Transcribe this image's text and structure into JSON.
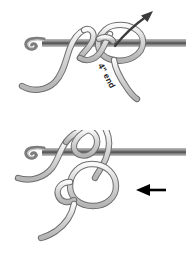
{
  "diagram": {
    "background_color": "#ffffff",
    "yarn_fill_color": "#d2d2d2",
    "yarn_outline_color": "#6e6e6e",
    "hook_color": "#8d8d8d",
    "hook_dark_color": "#4a4a4a",
    "arrow_color": "#3b3b3b",
    "text_color": "#111111"
  },
  "panels": [
    {
      "id": "panel-top",
      "step_number": "1",
      "description": "Crochet hook through loop with yarn crossed, pull-through arrow and tail measurement label",
      "label": "4\" end",
      "arrow_name": "pull-direction-arrow"
    },
    {
      "id": "panel-bottom",
      "step_number": "2",
      "description": "Loop tightened into ring on hook with instruction callout",
      "callout": "Leave ring\nloose until\nstitches are\nmade.",
      "arrow_name": "callout-pointer-arrow"
    }
  ]
}
